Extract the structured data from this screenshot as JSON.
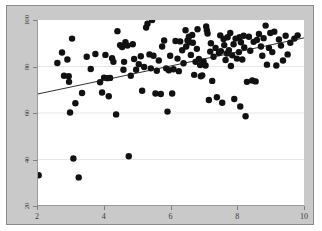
{
  "figure": {
    "width": 322,
    "height": 231,
    "background_color": "#ffffff",
    "panel_color": "#c9c9c9",
    "panel_border_color": "#8a8a8a",
    "plot_background_color": "#ffffff",
    "axis_color": "#9a9a9a",
    "tick_color": "#7d7d7d",
    "gridline_color": "#e6e6e6",
    "point_color": "#111111",
    "line_color": "#1a1a1a"
  },
  "chart_data": {
    "type": "scatter",
    "title": "",
    "subtitle": "",
    "xlabel": "",
    "ylabel": "",
    "xlim": [
      2,
      10
    ],
    "ylim": [
      20,
      100
    ],
    "xticks": [
      2,
      4,
      6,
      8,
      10
    ],
    "yticks": [
      20,
      40,
      60,
      80,
      100
    ],
    "xtick_labels": [
      "2",
      "4",
      "6",
      "8",
      "10"
    ],
    "ytick_labels": [
      "20",
      "40",
      "60",
      "80",
      "100"
    ],
    "ytick_label_rotation": -90,
    "grid": {
      "horizontal": true,
      "vertical": false
    },
    "legend": {
      "visible": false,
      "position": "none"
    },
    "annotations": [],
    "series": [
      {
        "name": "observations",
        "type": "scatter",
        "marker": "circle",
        "marker_size": 3.2,
        "color": "#111111",
        "points": [
          [
            2.02,
            33.2
          ],
          [
            2.58,
            81.5
          ],
          [
            2.72,
            86.0
          ],
          [
            2.78,
            76.0
          ],
          [
            2.88,
            83.0
          ],
          [
            2.92,
            75.8
          ],
          [
            2.93,
            73.4
          ],
          [
            2.96,
            60.2
          ],
          [
            3.02,
            92.0
          ],
          [
            3.06,
            40.4
          ],
          [
            3.12,
            64.2
          ],
          [
            3.22,
            32.3
          ],
          [
            3.32,
            68.6
          ],
          [
            3.46,
            84.2
          ],
          [
            3.58,
            78.9
          ],
          [
            3.72,
            85.4
          ],
          [
            3.86,
            73.2
          ],
          [
            3.92,
            68.8
          ],
          [
            3.98,
            75.2
          ],
          [
            4.02,
            85.0
          ],
          [
            4.08,
            75.0
          ],
          [
            4.12,
            67.2
          ],
          [
            4.16,
            75.1
          ],
          [
            4.22,
            83.6
          ],
          [
            4.26,
            82.0
          ],
          [
            4.34,
            59.4
          ],
          [
            4.38,
            95.2
          ],
          [
            4.46,
            89.2
          ],
          [
            4.52,
            88.4
          ],
          [
            4.56,
            78.6
          ],
          [
            4.58,
            82.0
          ],
          [
            4.62,
            90.4
          ],
          [
            4.68,
            89.0
          ],
          [
            4.72,
            41.4
          ],
          [
            4.78,
            76.0
          ],
          [
            4.84,
            89.6
          ],
          [
            4.88,
            83.2
          ],
          [
            4.94,
            78.6
          ],
          [
            5.02,
            81.0
          ],
          [
            5.08,
            84.4
          ],
          [
            5.12,
            69.6
          ],
          [
            5.18,
            79.8
          ],
          [
            5.24,
            96.8
          ],
          [
            5.28,
            98.4
          ],
          [
            5.34,
            85.2
          ],
          [
            5.38,
            79.2
          ],
          [
            5.42,
            100.0
          ],
          [
            5.46,
            84.6
          ],
          [
            5.52,
            68.4
          ],
          [
            5.56,
            78.2
          ],
          [
            5.62,
            82.6
          ],
          [
            5.68,
            68.2
          ],
          [
            5.72,
            88.6
          ],
          [
            5.78,
            91.2
          ],
          [
            5.84,
            79.2
          ],
          [
            5.88,
            60.6
          ],
          [
            5.92,
            78.4
          ],
          [
            5.96,
            84.6
          ],
          [
            6.02,
            68.4
          ],
          [
            6.06,
            78.8
          ],
          [
            6.12,
            91.0
          ],
          [
            6.18,
            83.4
          ],
          [
            6.22,
            78.0
          ],
          [
            6.26,
            90.8
          ],
          [
            6.32,
            87.0
          ],
          [
            6.36,
            81.4
          ],
          [
            6.42,
            95.6
          ],
          [
            6.44,
            88.6
          ],
          [
            6.48,
            91.2
          ],
          [
            6.52,
            92.8
          ],
          [
            6.54,
            90.4
          ],
          [
            6.58,
            85.0
          ],
          [
            6.62,
            93.6
          ],
          [
            6.64,
            90.2
          ],
          [
            6.68,
            76.4
          ],
          [
            6.72,
            82.0
          ],
          [
            6.76,
            87.6
          ],
          [
            6.78,
            96.0
          ],
          [
            6.82,
            83.2
          ],
          [
            6.86,
            80.6
          ],
          [
            6.88,
            75.8
          ],
          [
            6.92,
            76.2
          ],
          [
            6.96,
            82.2
          ],
          [
            7.02,
            80.4
          ],
          [
            7.04,
            97.2
          ],
          [
            7.06,
            95.6
          ],
          [
            7.08,
            94.2
          ],
          [
            7.12,
            65.6
          ],
          [
            7.16,
            86.4
          ],
          [
            7.18,
            90.0
          ],
          [
            7.22,
            73.8
          ],
          [
            7.26,
            84.2
          ],
          [
            7.32,
            88.0
          ],
          [
            7.36,
            66.8
          ],
          [
            7.42,
            85.8
          ],
          [
            7.46,
            93.4
          ],
          [
            7.48,
            86.6
          ],
          [
            7.52,
            64.4
          ],
          [
            7.56,
            91.8
          ],
          [
            7.58,
            89.2
          ],
          [
            7.62,
            82.8
          ],
          [
            7.66,
            85.6
          ],
          [
            7.68,
            92.6
          ],
          [
            7.72,
            87.0
          ],
          [
            7.76,
            94.4
          ],
          [
            7.78,
            80.2
          ],
          [
            7.82,
            84.8
          ],
          [
            7.86,
            89.6
          ],
          [
            7.88,
            66.0
          ],
          [
            7.92,
            92.0
          ],
          [
            7.96,
            83.4
          ],
          [
            8.02,
            86.2
          ],
          [
            8.04,
            92.6
          ],
          [
            8.06,
            62.8
          ],
          [
            8.08,
            90.4
          ],
          [
            8.12,
            83.0
          ],
          [
            8.16,
            93.2
          ],
          [
            8.18,
            88.2
          ],
          [
            8.22,
            58.6
          ],
          [
            8.26,
            73.4
          ],
          [
            8.32,
            92.8
          ],
          [
            8.36,
            86.8
          ],
          [
            8.42,
            74.0
          ],
          [
            8.46,
            90.6
          ],
          [
            8.52,
            73.6
          ],
          [
            8.56,
            91.4
          ],
          [
            8.62,
            94.0
          ],
          [
            8.68,
            88.6
          ],
          [
            8.72,
            84.6
          ],
          [
            8.76,
            92.2
          ],
          [
            8.82,
            97.6
          ],
          [
            8.86,
            80.8
          ],
          [
            8.92,
            88.0
          ],
          [
            8.96,
            94.4
          ],
          [
            9.02,
            86.2
          ],
          [
            9.08,
            95.0
          ],
          [
            9.14,
            80.4
          ],
          [
            9.22,
            91.6
          ],
          [
            9.28,
            89.0
          ],
          [
            9.34,
            82.6
          ],
          [
            9.42,
            93.2
          ],
          [
            9.48,
            85.2
          ],
          [
            9.56,
            90.2
          ],
          [
            9.68,
            92.0
          ],
          [
            9.78,
            93.4
          ]
        ]
      },
      {
        "name": "regression-line",
        "type": "line",
        "color": "#1a1a1a",
        "width": 0.9,
        "x": [
          2,
          10
        ],
        "y": [
          68.2,
          92.4
        ]
      }
    ]
  }
}
